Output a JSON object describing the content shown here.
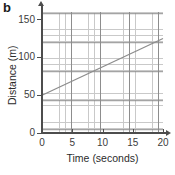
{
  "figure": {
    "part_label": "b"
  },
  "chart_data": {
    "type": "line",
    "title": "",
    "subtitle": "",
    "xlabel": "Time (seconds)",
    "ylabel": "Distance (m)",
    "xlim": [
      0,
      20
    ],
    "ylim": [
      0,
      160
    ],
    "xticks": [
      0,
      5,
      10,
      15,
      20
    ],
    "xtick_labels": [
      "0",
      "5",
      "10",
      "15",
      "20"
    ],
    "yticks": [
      0,
      50,
      100,
      150
    ],
    "ytick_labels": [
      "0",
      "50",
      "100",
      "150"
    ],
    "x_minor_step": 1,
    "y_minor_step": 10,
    "grid": true,
    "grid_style": "minor and major rectangular grid",
    "legend": null,
    "legend_position": "none",
    "series": [
      {
        "name": "Distance vs time",
        "x": [
          0,
          20
        ],
        "values": [
          50,
          125
        ],
        "line_color": "#8c8c8c",
        "line_width": 1.2,
        "markers": false,
        "description": "straight line of constant gradient, intercept 50 m, slope 3.75 m/s"
      }
    ],
    "annotations": []
  }
}
